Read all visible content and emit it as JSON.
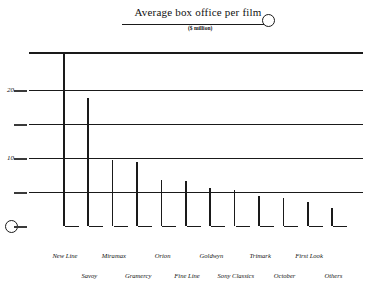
{
  "chart_data": {
    "type": "bar",
    "title": "Average box office per film",
    "subtitle": "($ million)",
    "xlabel": "",
    "ylabel": "",
    "ylim": [
      0,
      25.5
    ],
    "yticks": [
      5,
      10,
      15,
      20
    ],
    "ytick_labels": [
      "",
      "10",
      "",
      "20"
    ],
    "grid": true,
    "legend": "none",
    "orientation": "vertical-lines",
    "categories": [
      "New Line",
      "Savoy",
      "Miramax",
      "Gramercy",
      "Orion",
      "Fine Line",
      "Goldwyn",
      "Sony Classics",
      "Trimark",
      "October",
      "First Look",
      "Others"
    ],
    "values": [
      25.4,
      18.8,
      9.7,
      9.4,
      6.8,
      6.6,
      5.6,
      5.3,
      4.4,
      4.1,
      3.5,
      2.6
    ]
  },
  "axis": {
    "tick_20": "20",
    "tick_10": "10"
  }
}
